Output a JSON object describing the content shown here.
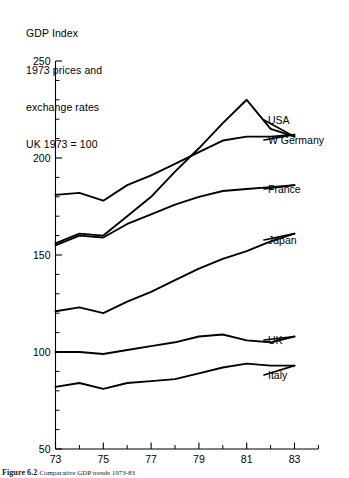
{
  "figure": {
    "title_lines": [
      "GDP Index",
      "1973 prices and",
      "exchange rates",
      "UK 1973 = 100"
    ],
    "caption_label": "Figure 6.2",
    "caption_text": "Comparative GDP trends 1973-83"
  },
  "chart_data": {
    "type": "line",
    "title": "GDP Index 1973 prices and exchange rates UK 1973 = 100",
    "xlabel": "",
    "ylabel": "GDP Index",
    "xlim": [
      73,
      84
    ],
    "ylim": [
      50,
      250
    ],
    "grid": false,
    "legend_position": "right-inline-labels",
    "x": [
      73,
      74,
      75,
      76,
      77,
      78,
      79,
      80,
      81,
      82,
      83
    ],
    "xtick_labels": [
      "73",
      "75",
      "77",
      "79",
      "81",
      "83"
    ],
    "xtick_values": [
      73,
      75,
      77,
      79,
      81,
      83
    ],
    "ytick_labels": [
      "50",
      "100",
      "150",
      "200",
      "250"
    ],
    "ytick_values": [
      50,
      100,
      150,
      200,
      250
    ],
    "yminor_step": 10,
    "series": [
      {
        "name": "USA",
        "label": "USA",
        "values": [
          156,
          161,
          160,
          170,
          180,
          193,
          205,
          218,
          230,
          215,
          211
        ]
      },
      {
        "name": "W Germany",
        "label": "W Germany",
        "values": [
          181,
          182,
          178,
          186,
          191,
          197,
          203,
          209,
          211,
          211,
          212
        ]
      },
      {
        "name": "France",
        "label": "France",
        "values": [
          155,
          160,
          159,
          166,
          171,
          176,
          180,
          183,
          184,
          185,
          186
        ]
      },
      {
        "name": "Japan",
        "label": "Japan",
        "values": [
          121,
          123,
          120,
          126,
          131,
          137,
          143,
          148,
          152,
          157,
          161
        ]
      },
      {
        "name": "UK",
        "label": "UK",
        "values": [
          100,
          100,
          99,
          101,
          103,
          105,
          108,
          109,
          106,
          105,
          108
        ]
      },
      {
        "name": "Italy",
        "label": "Italy",
        "values": [
          82,
          84,
          81,
          84,
          85,
          86,
          89,
          92,
          94,
          93,
          93
        ]
      }
    ]
  }
}
